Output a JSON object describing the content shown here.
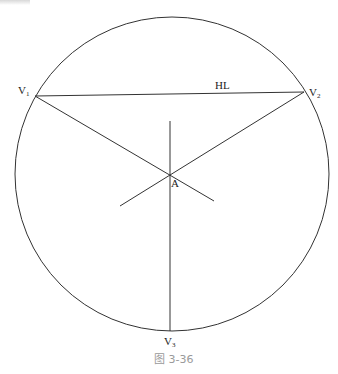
{
  "diagram": {
    "type": "three-point perspective construction",
    "circle": {
      "cx": 172,
      "cy": 174,
      "r": 157
    },
    "points": {
      "V1": {
        "x": 35,
        "y": 96,
        "label": "V",
        "sub": "1"
      },
      "V2": {
        "x": 304,
        "y": 92,
        "label": "V",
        "sub": "2"
      },
      "V3": {
        "x": 170,
        "y": 331,
        "label": "V",
        "sub": "3"
      },
      "A": {
        "x": 170,
        "y": 174,
        "label": "A"
      }
    },
    "horizon_label": "HL",
    "caption": "图 3-36"
  },
  "colors": {
    "line": "#333333",
    "caption": "#9a9a9a"
  }
}
